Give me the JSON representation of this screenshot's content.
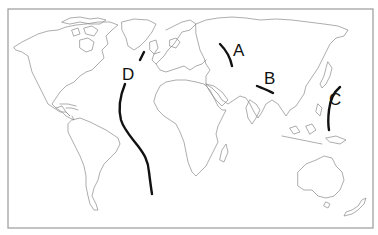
{
  "map": {
    "type": "world outline map",
    "frame_color": "#9a9a9a",
    "coast_color": "#8a8a8a",
    "line_color": "#111111",
    "labels": [
      {
        "id": "A",
        "text": "A",
        "region": "Ural Mountains"
      },
      {
        "id": "B",
        "text": "B",
        "region": "Himalayas"
      },
      {
        "id": "C",
        "text": "C",
        "region": "Japan / West Pacific trench"
      },
      {
        "id": "D",
        "text": "D",
        "region": "Mid-Atlantic Ridge"
      }
    ]
  }
}
